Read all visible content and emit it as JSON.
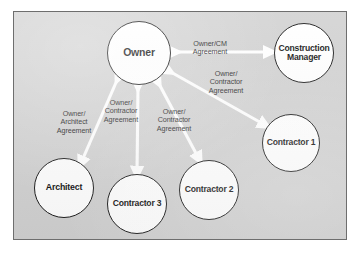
{
  "diagram": {
    "type": "node-link-diagram",
    "panel": {
      "background_color": "#d2d2d2",
      "border_color": "#6e6e6e"
    },
    "arrow_color": "#ffffff",
    "node_fill_color": "#ffffff",
    "node_border_color": "#1b1b1b",
    "nodes": [
      {
        "id": "owner",
        "label": "Owner",
        "cx": 125,
        "cy": 41,
        "r": 32
      },
      {
        "id": "cm",
        "label": "Construction\nManager",
        "cx": 290,
        "cy": 41,
        "r": 30
      },
      {
        "id": "c1",
        "label": "Contractor\n1",
        "cx": 277,
        "cy": 131,
        "r": 29
      },
      {
        "id": "c2",
        "label": "Contractor\n2",
        "cx": 195,
        "cy": 178,
        "r": 30
      },
      {
        "id": "c3",
        "label": "Contractor\n3",
        "cx": 123,
        "cy": 192,
        "r": 30
      },
      {
        "id": "arch",
        "label": "Architect",
        "cx": 50,
        "cy": 176,
        "r": 30
      }
    ],
    "edges": [
      {
        "id": "owner-cm",
        "from": "owner",
        "to": "cm",
        "label": "Owner/CM\nAgreement",
        "label_x": 196,
        "label_y": 28,
        "double_headed": true
      },
      {
        "id": "owner-c1",
        "from": "owner",
        "to": "c1",
        "label": "Owner/\nContractor\nAgreement",
        "label_x": 212,
        "label_y": 58,
        "double_headed": true
      },
      {
        "id": "owner-c2",
        "from": "owner",
        "to": "c2",
        "label": "Owner/\nContractor\nAgreement",
        "label_x": 160,
        "label_y": 96,
        "double_headed": true
      },
      {
        "id": "owner-c3",
        "from": "owner",
        "to": "c3",
        "label": "Owner/\nContractor\nAgreement",
        "label_x": 107,
        "label_y": 87,
        "double_headed": true
      },
      {
        "id": "owner-arch",
        "from": "owner",
        "to": "arch",
        "label": "Owner/\nArchitect\nAgreement",
        "label_x": 60,
        "label_y": 98,
        "double_headed": true
      }
    ]
  }
}
